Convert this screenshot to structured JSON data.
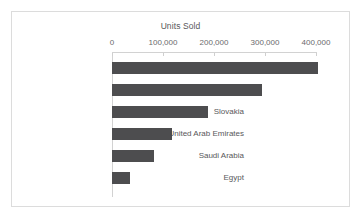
{
  "chart_data": {
    "type": "bar",
    "orientation": "horizontal",
    "title": "Units Sold",
    "xlabel": "",
    "ylabel": "",
    "categories": [
      "Russia",
      "Czech Republic",
      "Slovakia",
      "United Arab Emirates",
      "Saudi Arabia",
      "Egypt"
    ],
    "values": [
      404000,
      294000,
      188000,
      118000,
      82000,
      35000
    ],
    "xlim": [
      0,
      400000
    ],
    "xticks": [
      0,
      100000,
      200000,
      300000,
      400000
    ],
    "xtick_labels": [
      "0",
      "100,000",
      "200,000",
      "300,000",
      "400,000"
    ],
    "grid": false,
    "legend": false,
    "bar_color": "#4d4d4f",
    "axis_color": "#d2d2d2",
    "frame_color": "#dcdcdc",
    "text_color": "#58585a"
  }
}
